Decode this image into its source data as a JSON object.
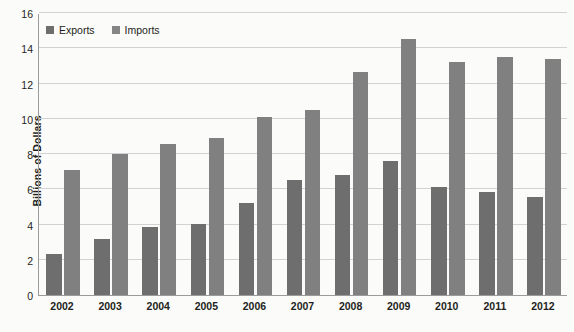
{
  "chart_data": {
    "type": "bar",
    "title": "",
    "xlabel": "",
    "ylabel": "Billions of Dollars",
    "categories": [
      "2002",
      "2003",
      "2004",
      "2005",
      "2006",
      "2007",
      "2008",
      "2009",
      "2010",
      "2011",
      "2012"
    ],
    "series": [
      {
        "name": "Exports",
        "color": "#6e6e6e",
        "values": [
          2.35,
          3.2,
          3.85,
          4.05,
          5.2,
          6.5,
          6.8,
          7.6,
          6.15,
          5.85,
          5.55
        ]
      },
      {
        "name": "Imports",
        "color": "#808080",
        "values": [
          7.1,
          8.0,
          8.55,
          8.9,
          10.1,
          10.5,
          12.65,
          14.5,
          13.2,
          13.5,
          13.4
        ]
      }
    ],
    "ylim": [
      0,
      16
    ],
    "yticks": [
      0,
      2,
      4,
      6,
      8,
      10,
      12,
      14,
      16
    ],
    "grid": true,
    "legend_position": "top-left"
  },
  "legend": {
    "items": [
      {
        "label": "Exports"
      },
      {
        "label": "Imports"
      }
    ]
  }
}
